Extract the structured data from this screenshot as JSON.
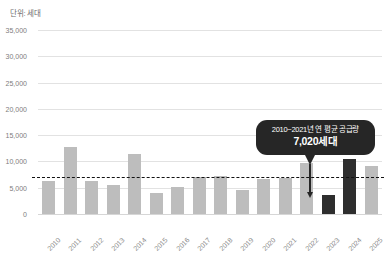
{
  "unit_label": "단위: 세대",
  "callout": {
    "title": "2010~2021년 연 평균 공급량",
    "value": "7,020세대"
  },
  "chart_data": {
    "type": "bar",
    "title": "",
    "subtitle": "",
    "xlabel": "",
    "ylabel": "단위: 세대",
    "ylim": [
      0,
      35000
    ],
    "ytick_step": 5000,
    "ytick_labels": [
      "35,000",
      "30,000",
      "25,000",
      "20,000",
      "15,000",
      "10,000",
      "5,000",
      "0"
    ],
    "ytick_values": [
      35000,
      30000,
      25000,
      20000,
      15000,
      10000,
      5000,
      0
    ],
    "grid": true,
    "legend": "none",
    "categories": [
      "2010",
      "2011",
      "2012",
      "2013",
      "2014",
      "2015",
      "2016",
      "2017",
      "2018",
      "2019",
      "2020",
      "2021",
      "2022",
      "2023",
      "2024",
      "2025"
    ],
    "values": [
      6200,
      12700,
      6200,
      5500,
      11500,
      4000,
      5100,
      7100,
      7200,
      4600,
      6700,
      6800,
      9700,
      3700,
      10500,
      9200
    ],
    "bar_tones": [
      "light",
      "light",
      "light",
      "light",
      "light",
      "light",
      "light",
      "light",
      "light",
      "light",
      "light",
      "light",
      "light",
      "dark",
      "dark",
      "light"
    ],
    "colors": {
      "bar_light": "#bdbdbd",
      "bar_dark": "#2e2e2e",
      "gridline": "#e2e2e2",
      "average_line": "#111111",
      "callout_bg": "#262626",
      "callout_text": "#ffffff",
      "tick_text": "#8a8a8a",
      "background": "#ffffff"
    },
    "annotations": [
      {
        "type": "average-line",
        "label": "2010~2021년 연 평균 공급량",
        "value": 7020,
        "value_label": "7,020세대",
        "style": "dashed",
        "points_to": "2023"
      }
    ]
  }
}
